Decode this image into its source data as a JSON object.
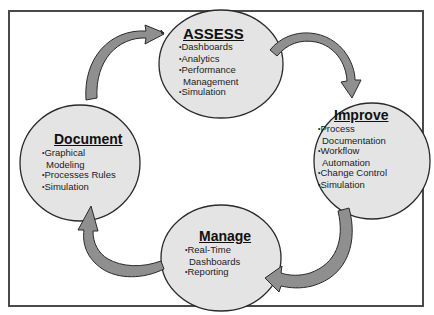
{
  "diagram": {
    "type": "cycle",
    "colors": {
      "circle_fill": "#e4e4e4",
      "circle_stroke": "#2a2a2a",
      "arrow_fill": "#8f8f8f",
      "arrow_stroke": "#2a2a2a",
      "frame_border": "#4a4a4a"
    },
    "nodes": [
      {
        "id": "assess",
        "title": "ASSESS",
        "items": [
          "Dashboards",
          "Analytics",
          "Performance Management",
          "Simulation"
        ]
      },
      {
        "id": "improve",
        "title": "Improve",
        "items": [
          "Process Documentation",
          "Workflow Automation",
          "Change Control",
          "Simulation"
        ]
      },
      {
        "id": "manage",
        "title": "Manage",
        "items": [
          "Real-Time Dashboards",
          "Reporting"
        ]
      },
      {
        "id": "document",
        "title": "Document",
        "items": [
          "Graphical Modeling",
          "Processes Rules",
          "Simulation"
        ]
      }
    ],
    "edges": [
      {
        "from": "document",
        "to": "assess"
      },
      {
        "from": "assess",
        "to": "improve"
      },
      {
        "from": "improve",
        "to": "manage"
      },
      {
        "from": "manage",
        "to": "document"
      }
    ]
  }
}
